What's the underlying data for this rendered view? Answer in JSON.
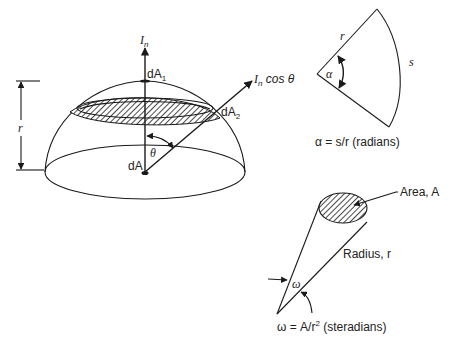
{
  "figure": {
    "hemisphere": {
      "normal_intensity_label": "I",
      "normal_intensity_sub": "n",
      "oblique_intensity_label": "I",
      "oblique_intensity_sub": "n",
      "oblique_intensity_suffix": " cos θ",
      "dA1_label": "dA",
      "dA1_sub": "1",
      "dA2_label": "dA",
      "dA2_sub": "2",
      "dA_label": "dA",
      "theta_label": "θ",
      "radius_label": "r"
    },
    "plane_angle": {
      "radius_label": "r",
      "arc_label": "s",
      "angle_label": "α",
      "formula": "α = s/r (radians)"
    },
    "solid_angle": {
      "area_label": "Area, A",
      "radius_label": "Radius, r",
      "angle_label": "ω",
      "formula_prefix": "ω = A/r",
      "formula_exp": "2",
      "formula_suffix": " (steradians)"
    }
  }
}
